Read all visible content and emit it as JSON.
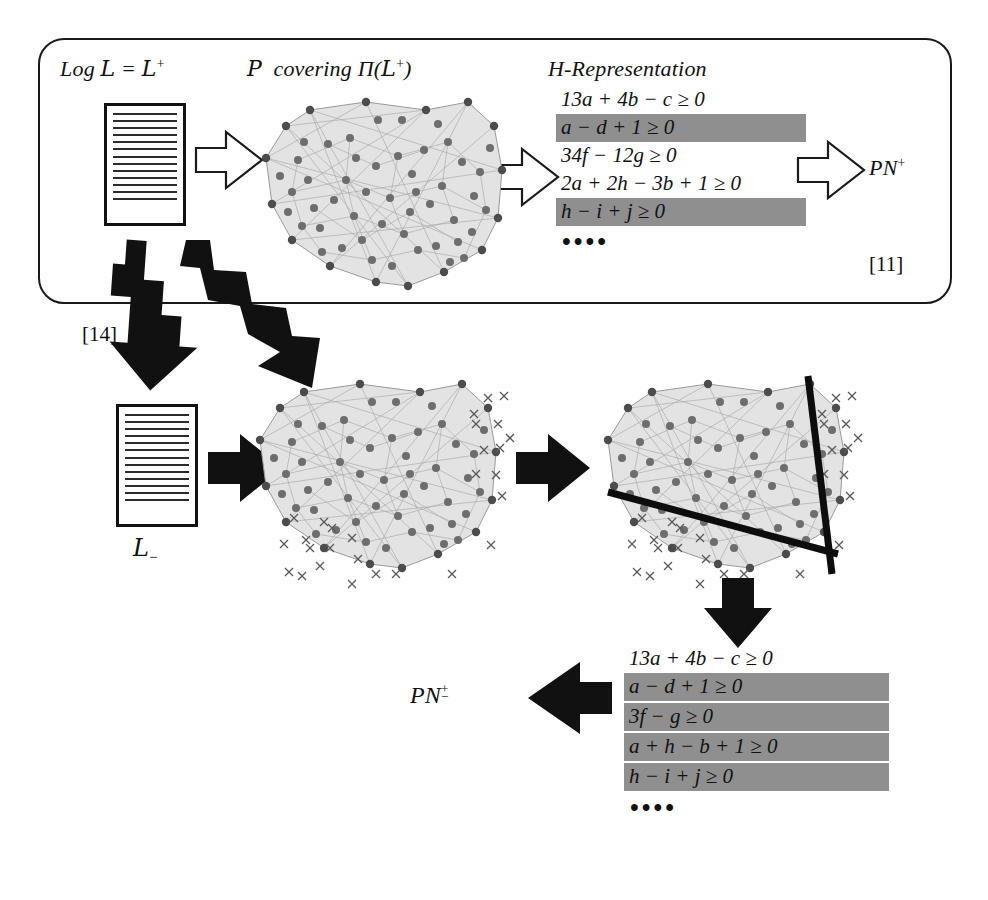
{
  "figure": {
    "type": "pipeline-diagram",
    "title_text_absent": true
  },
  "top_box": {
    "stage1": {
      "label": "Log ℒ = ℒ⁺",
      "label_parts": {
        "prefix": "Log",
        "symbol": "L",
        "equals": "=",
        "symbol2": "L",
        "sup": "+"
      },
      "icon": "document-icon",
      "line_count": 13
    },
    "stage2": {
      "label": "𝒫 covering Π(ℒ⁺)",
      "label_parts": {
        "p": "P",
        "word": "covering",
        "pi": "Π",
        "open": "(",
        "symbol": "L",
        "sup": "+",
        "close": ")"
      },
      "icon": "polytope-point-cloud"
    },
    "stage3": {
      "label": "H-Representation",
      "equations": [
        {
          "text": "13a + 4b − c ≥ 0",
          "highlighted": false
        },
        {
          "text": "a − d + 1 ≥ 0",
          "highlighted": true
        },
        {
          "text": "34f − 12g ≥ 0",
          "highlighted": false
        },
        {
          "text": "2a + 2h − 3b + 1 ≥ 0",
          "highlighted": false
        },
        {
          "text": "h − i + j ≥ 0",
          "highlighted": true
        }
      ],
      "ellipsis": "••••"
    },
    "stage4": {
      "label": "PN⁺",
      "label_parts": {
        "base": "PN",
        "sup": "+"
      }
    },
    "citation": "[11]",
    "arrows": [
      "hollow-arrow-1",
      "hollow-arrow-2",
      "hollow-arrow-3"
    ]
  },
  "lower_flow": {
    "citation": "[14]",
    "neg_log": {
      "label": "ℒ₋",
      "label_parts": {
        "symbol": "L",
        "sub": "−"
      },
      "icon": "document-icon",
      "line_count": 13
    },
    "stage_b": {
      "icon": "polytope-with-negative-points"
    },
    "stage_c": {
      "icon": "polytope-with-separating-hyperplanes",
      "separator_count": 2
    },
    "result_equations": [
      {
        "text": "13a + 4b − c ≥ 0",
        "highlighted": false
      },
      {
        "text": "a − d + 1 ≥ 0",
        "highlighted": true
      },
      {
        "text": "3f − g ≥ 0",
        "highlighted": true
      },
      {
        "text": "a + h − b + 1 ≥ 0",
        "highlighted": true
      },
      {
        "text": "h − i + j ≥ 0",
        "highlighted": true
      }
    ],
    "result_ellipsis": "••••",
    "result_label": {
      "base": "PN",
      "sup": "+",
      "sub": "−"
    },
    "arrows": [
      "zigzag-arrow-left",
      "zigzag-arrow-right",
      "solid-arrow-1",
      "solid-arrow-2",
      "solid-arrow-down",
      "solid-arrow-left"
    ]
  },
  "colors": {
    "highlight_gray": "#8f8f8f",
    "hull_fill": "#e3e3e3",
    "hull_stroke": "#9a9a9a",
    "ink": "#111111"
  }
}
